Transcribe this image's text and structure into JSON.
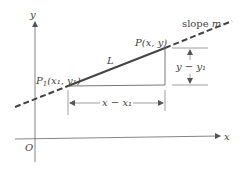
{
  "diagram": {
    "type": "point-slope line diagram",
    "labels": {
      "y_axis": "y",
      "x_axis": "x",
      "origin": "O",
      "point_p1": "P",
      "point_p1_sub": "1",
      "point_p1_coords": "(x₁, y₁)",
      "point_p": "P(x, y)",
      "line": "L",
      "slope_prefix": "slope ",
      "slope_var": "m",
      "dx": "x − x₁",
      "dy": "y − y₁"
    },
    "colors": {
      "line": "#444444",
      "axis": "#555555",
      "text": "#444444"
    }
  }
}
